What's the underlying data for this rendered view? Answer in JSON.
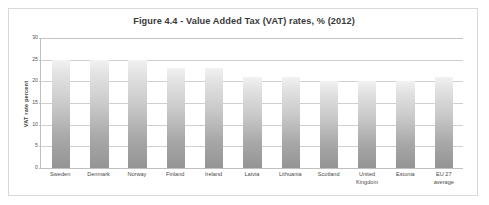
{
  "chart_data": {
    "type": "bar",
    "title": "Figure 4.4 - Value Added Tax (VAT) rates, % (2012)",
    "xlabel": "",
    "ylabel": "VAT rate percent",
    "ylim": [
      0,
      30
    ],
    "yticks": [
      30,
      25,
      20,
      15,
      10,
      5,
      0
    ],
    "ytick_labels": [
      "30",
      "25",
      "20",
      "15",
      "10",
      "5",
      "0"
    ],
    "grid": true,
    "legend": "none",
    "categories": [
      "Sweden",
      "Denmark",
      "Norway",
      "Finland",
      "Ireland",
      "Latvia",
      "Lithuania",
      "Scotland",
      "United\nKingdom",
      "Estonia",
      "EU 27\naverage"
    ],
    "values": [
      25,
      25,
      25,
      23,
      23,
      21,
      21,
      20,
      20,
      20,
      21
    ],
    "bar_color_top": "#f2f2f2",
    "bar_color_bottom": "#949494",
    "gridline_color": "#d0d0d0",
    "axis_color": "#bfbfbf",
    "frame_color": "#d9d9d9",
    "background": "#ffffff"
  }
}
